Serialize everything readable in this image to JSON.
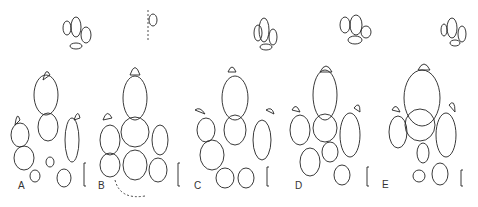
{
  "figure": {
    "panels": [
      {
        "label": "A"
      },
      {
        "label": "B"
      },
      {
        "label": "C"
      },
      {
        "label": "D"
      },
      {
        "label": "E"
      }
    ]
  }
}
